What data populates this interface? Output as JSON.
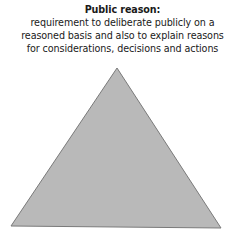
{
  "diagram": {
    "label": {
      "title": "Public reason:",
      "lines": [
        "requirement to deliberate publicly on a",
        "reasoned basis and also to explain reasons",
        "for considerations, decisions and actions"
      ]
    },
    "shape": {
      "type": "triangle",
      "fill": "#b9b9b9",
      "stroke": "#7a7a7a",
      "vertices": {
        "apex": [
          117,
          68
        ],
        "bottom_left": [
          11,
          226
        ],
        "bottom_right": [
          221,
          228
        ]
      }
    }
  }
}
